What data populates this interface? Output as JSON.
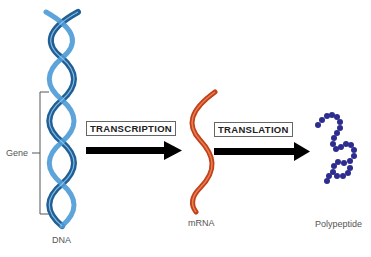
{
  "diagram": {
    "title": "",
    "nodes": [
      {
        "id": "dna",
        "label": "DNA",
        "color": "#2f7fbf"
      },
      {
        "id": "mrna",
        "label": "mRNA",
        "color": "#d2541e"
      },
      {
        "id": "polypeptide",
        "label": "Polypeptide",
        "color": "#2a2a86"
      }
    ],
    "edges": [
      {
        "from": "dna",
        "to": "mrna",
        "label": "TRANSCRIPTION"
      },
      {
        "from": "mrna",
        "to": "polypeptide",
        "label": "TRANSLATION"
      }
    ],
    "annotations": {
      "gene_bracket_label": "Gene"
    }
  }
}
